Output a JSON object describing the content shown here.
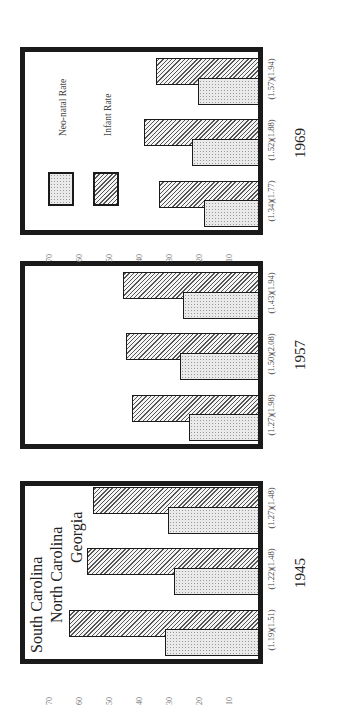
{
  "chart_data": {
    "type": "bar",
    "title": "",
    "xlabel": "",
    "ylabel": "",
    "ylim": [
      0,
      70
    ],
    "yticks": [
      10,
      20,
      30,
      40,
      50,
      60,
      70
    ],
    "grid": false,
    "legend": {
      "position": "inside top-left of 1969 panel",
      "entries": [
        {
          "name": "Neo-natal Rate",
          "pattern": "dotted"
        },
        {
          "name": "Infant Rate",
          "pattern": "hatched"
        }
      ]
    },
    "state_labels": [
      "South Carolina",
      "North Carolina",
      "Georgia"
    ],
    "panels": [
      {
        "year": "1945",
        "categories": [
          "South Carolina",
          "North Carolina",
          "Georgia"
        ],
        "series": [
          {
            "name": "Neo-natal Rate",
            "values": [
              31,
              28,
              30
            ]
          },
          {
            "name": "Infant Rate",
            "values": [
              63,
              57,
              55
            ]
          }
        ],
        "ratio_labels": [
          "(1.19)(1.51)",
          "(1.22)(1.48)",
          "(1.27)(1.48)"
        ]
      },
      {
        "year": "1957",
        "categories": [
          "South Carolina",
          "North Carolina",
          "Georgia"
        ],
        "series": [
          {
            "name": "Neo-natal Rate",
            "values": [
              23,
              26,
              25
            ]
          },
          {
            "name": "Infant Rate",
            "values": [
              42,
              44,
              45
            ]
          }
        ],
        "ratio_labels": [
          "(1.27)(1.98)",
          "(1.50)(2.08)",
          "(1.43)(1.94)"
        ]
      },
      {
        "year": "1969",
        "categories": [
          "South Carolina",
          "North Carolina",
          "Georgia"
        ],
        "series": [
          {
            "name": "Neo-natal Rate",
            "values": [
              18,
              22,
              20
            ]
          },
          {
            "name": "Infant Rate",
            "values": [
              33,
              38,
              34
            ]
          }
        ],
        "ratio_labels": [
          "(1.34)(1.77)",
          "(1.52)(1.88)",
          "(1.57)(1.94)"
        ]
      }
    ]
  },
  "colors": {
    "frame": "#1a1a1a",
    "text": "#222222",
    "tick_text": "#777777"
  }
}
